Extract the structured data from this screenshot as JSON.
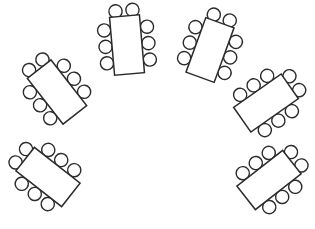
{
  "document": {
    "title": "Banquet Seating Arrangement",
    "description": "Semicircular horseshoe arrangement of seven rectangular banquet tables, each surrounded by eight round chairs.",
    "canvas": {
      "width": 315,
      "height": 229
    },
    "background_color": "#ffffff"
  },
  "style": {
    "stroke_color": "#2b2b2b",
    "table_fill": "#ffffff",
    "chair_fill": "#ffffff",
    "table_stroke_width": 1.5,
    "chair_stroke_width": 1.4
  },
  "legend": {
    "table_shape": "rectangle",
    "chair_shape": "circle",
    "chairs_per_table": 8,
    "table_count": 7,
    "total_seats": 56
  },
  "chair_geometry": {
    "radius": 6.6,
    "side_offset": 21.5,
    "head_offset": 34.5,
    "head_spread": 8.5,
    "side_spacing": 16.5
  },
  "tables": [
    {
      "id": "table-1",
      "label": "Table 1",
      "center_x": 57,
      "center_y": 92,
      "width": 30,
      "height": 58,
      "rotation": -38,
      "seats": 8,
      "chairs": [
        {
          "id": "t1-c1",
          "side": "head",
          "index": 1
        },
        {
          "id": "t1-c2",
          "side": "head",
          "index": 2
        },
        {
          "id": "t1-c3",
          "side": "left",
          "index": 1
        },
        {
          "id": "t1-c4",
          "side": "left",
          "index": 2
        },
        {
          "id": "t1-c5",
          "side": "left",
          "index": 3
        },
        {
          "id": "t1-c6",
          "side": "right",
          "index": 1
        },
        {
          "id": "t1-c7",
          "side": "right",
          "index": 2
        },
        {
          "id": "t1-c8",
          "side": "right",
          "index": 3
        }
      ]
    },
    {
      "id": "table-2",
      "label": "Table 2",
      "center_x": 127,
      "center_y": 45,
      "width": 30,
      "height": 58,
      "rotation": -5,
      "seats": 8,
      "chairs": [
        {
          "id": "t2-c1",
          "side": "head",
          "index": 1
        },
        {
          "id": "t2-c2",
          "side": "head",
          "index": 2
        },
        {
          "id": "t2-c3",
          "side": "left",
          "index": 1
        },
        {
          "id": "t2-c4",
          "side": "left",
          "index": 2
        },
        {
          "id": "t2-c5",
          "side": "left",
          "index": 3
        },
        {
          "id": "t2-c6",
          "side": "right",
          "index": 1
        },
        {
          "id": "t2-c7",
          "side": "right",
          "index": 2
        },
        {
          "id": "t2-c8",
          "side": "right",
          "index": 3
        }
      ]
    },
    {
      "id": "table-3",
      "label": "Table 3",
      "center_x": 210,
      "center_y": 50,
      "width": 30,
      "height": 58,
      "rotation": 20,
      "seats": 8,
      "chairs": [
        {
          "id": "t3-c1",
          "side": "head",
          "index": 1
        },
        {
          "id": "t3-c2",
          "side": "head",
          "index": 2
        },
        {
          "id": "t3-c3",
          "side": "left",
          "index": 1
        },
        {
          "id": "t3-c4",
          "side": "left",
          "index": 2
        },
        {
          "id": "t3-c5",
          "side": "left",
          "index": 3
        },
        {
          "id": "t3-c6",
          "side": "right",
          "index": 1
        },
        {
          "id": "t3-c7",
          "side": "right",
          "index": 2
        },
        {
          "id": "t3-c8",
          "side": "right",
          "index": 3
        }
      ]
    },
    {
      "id": "table-4",
      "label": "Table 4",
      "center_x": 266,
      "center_y": 103,
      "width": 30,
      "height": 58,
      "rotation": 55,
      "seats": 8,
      "chairs": [
        {
          "id": "t4-c1",
          "side": "head",
          "index": 1
        },
        {
          "id": "t4-c2",
          "side": "head",
          "index": 2
        },
        {
          "id": "t4-c3",
          "side": "left",
          "index": 1
        },
        {
          "id": "t4-c4",
          "side": "left",
          "index": 2
        },
        {
          "id": "t4-c5",
          "side": "left",
          "index": 3
        },
        {
          "id": "t4-c6",
          "side": "right",
          "index": 1
        },
        {
          "id": "t4-c7",
          "side": "right",
          "index": 2
        },
        {
          "id": "t4-c8",
          "side": "right",
          "index": 3
        }
      ]
    },
    {
      "id": "table-5",
      "label": "Table 5",
      "center_x": 269,
      "center_y": 180,
      "width": 30,
      "height": 58,
      "rotation": 52,
      "seats": 8,
      "chairs": [
        {
          "id": "t5-c1",
          "side": "head",
          "index": 1
        },
        {
          "id": "t5-c2",
          "side": "head",
          "index": 2
        },
        {
          "id": "t5-c3",
          "side": "left",
          "index": 1
        },
        {
          "id": "t5-c4",
          "side": "left",
          "index": 2
        },
        {
          "id": "t5-c5",
          "side": "left",
          "index": 3
        },
        {
          "id": "t5-c6",
          "side": "right",
          "index": 1
        },
        {
          "id": "t5-c7",
          "side": "right",
          "index": 2
        },
        {
          "id": "t5-c8",
          "side": "right",
          "index": 3
        }
      ]
    },
    {
      "id": "table-6",
      "label": "Table 6",
      "center_x": 48,
      "center_y": 177,
      "width": 30,
      "height": 58,
      "rotation": -52,
      "seats": 8,
      "chairs": [
        {
          "id": "t6-c1",
          "side": "head",
          "index": 1
        },
        {
          "id": "t6-c2",
          "side": "head",
          "index": 2
        },
        {
          "id": "t6-c3",
          "side": "left",
          "index": 1
        },
        {
          "id": "t6-c4",
          "side": "left",
          "index": 2
        },
        {
          "id": "t6-c5",
          "side": "left",
          "index": 3
        },
        {
          "id": "t6-c6",
          "side": "right",
          "index": 1
        },
        {
          "id": "t6-c7",
          "side": "right",
          "index": 2
        },
        {
          "id": "t6-c8",
          "side": "right",
          "index": 3
        }
      ]
    },
    {
      "id": "table-7",
      "label": "Table 7",
      "center_x": 169,
      "center_y": 40,
      "width": 0,
      "height": 0,
      "rotation": 0,
      "seats": 0,
      "hidden": true,
      "chairs": []
    }
  ]
}
